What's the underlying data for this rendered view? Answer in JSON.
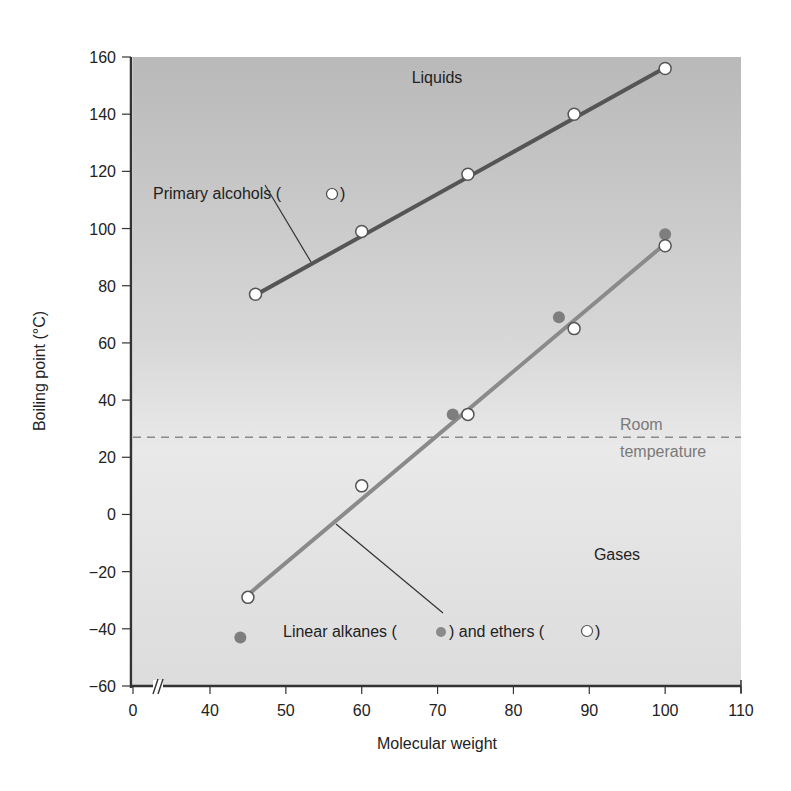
{
  "chart_data": {
    "type": "scatter",
    "title": "",
    "xlabel": "Molecular weight",
    "ylabel": "Boiling point (°C)",
    "xlim": [
      0,
      110
    ],
    "ylim": [
      -60,
      160
    ],
    "x_axis_break": true,
    "x_ticks": [
      0,
      40,
      50,
      60,
      70,
      80,
      90,
      100,
      110
    ],
    "y_ticks": [
      -60,
      -40,
      -20,
      0,
      20,
      40,
      60,
      80,
      100,
      120,
      140,
      160
    ],
    "grid": false,
    "series": [
      {
        "name": "Primary alcohols",
        "marker": "open-circle",
        "line_fit": true,
        "line_color": "#555555",
        "points": [
          {
            "x": 46,
            "y": 77
          },
          {
            "x": 60,
            "y": 99
          },
          {
            "x": 74,
            "y": 119
          },
          {
            "x": 88,
            "y": 140
          },
          {
            "x": 100,
            "y": 156
          }
        ],
        "fit_line": [
          {
            "x": 45.5,
            "y": 76
          },
          {
            "x": 99.8,
            "y": 156
          }
        ]
      },
      {
        "name": "Linear alkanes",
        "marker": "filled-circle",
        "line_fit": false,
        "color": "#7e7e7e",
        "points": [
          {
            "x": 44,
            "y": -43
          },
          {
            "x": 72,
            "y": 35
          },
          {
            "x": 86,
            "y": 69
          },
          {
            "x": 100,
            "y": 98
          }
        ]
      },
      {
        "name": "Ethers",
        "marker": "open-circle",
        "line_fit": true,
        "line_color": "#8a8a8a",
        "points": [
          {
            "x": 45,
            "y": -29
          },
          {
            "x": 60,
            "y": 10
          },
          {
            "x": 74,
            "y": 35
          },
          {
            "x": 88,
            "y": 65
          },
          {
            "x": 100,
            "y": 94
          }
        ],
        "fit_line": [
          {
            "x": 44.6,
            "y": -29
          },
          {
            "x": 99.7,
            "y": 94
          }
        ]
      }
    ],
    "reference_lines": [
      {
        "type": "horizontal",
        "y": 27,
        "style": "dashed",
        "label": "Room temperature"
      }
    ],
    "annotations": [
      {
        "text": "Liquids",
        "x": 75,
        "y": 150
      },
      {
        "text": "Gases",
        "x": 89,
        "y": -14
      },
      {
        "text": "Primary alcohols (○)",
        "x": 43,
        "y": 112
      },
      {
        "text": "Linear alkanes (●) and ethers (○)",
        "x": 70,
        "y": -41
      }
    ]
  },
  "labels": {
    "xlabel": "Molecular weight",
    "ylabel": "Boiling point (°C)",
    "liquids": "Liquids",
    "gases": "Gases",
    "room_1": "Room",
    "room_2": "temperature",
    "alcohols_text": "Primary alcohols (",
    "alcohols_close": ")",
    "alkanes_text": "Linear alkanes (",
    "and_ethers": ") and ethers (",
    "ethers_close": ")"
  }
}
